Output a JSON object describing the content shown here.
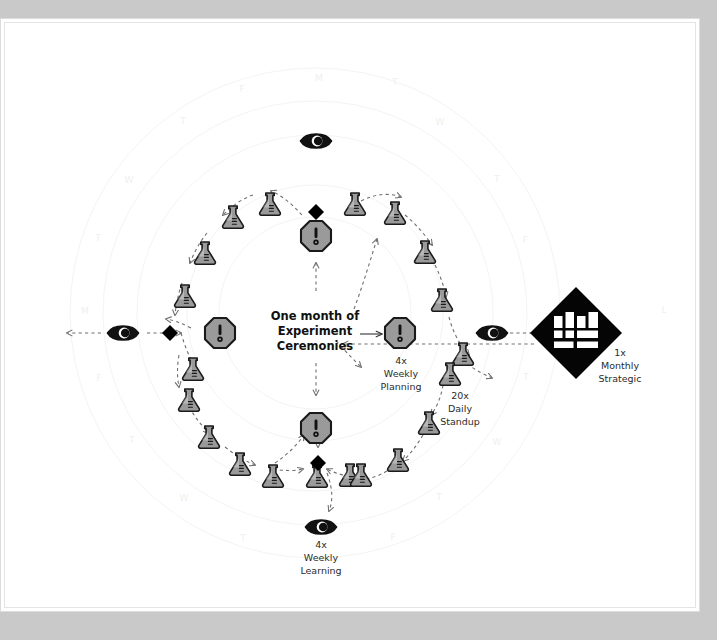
{
  "canvas": {
    "width": 717,
    "height": 640,
    "background_color": "#c9c9c9",
    "card_color": "#ffffff"
  },
  "diagram": {
    "type": "cycle-diagram",
    "title": "One month of\nExperiment\nCeremonies",
    "title_lines": [
      "One month of",
      "Experiment",
      "Ceremonies"
    ],
    "colors": {
      "icon_fill": "#9a9a9a",
      "icon_stroke": "#1a1a1a",
      "diamond_fill": "#000000",
      "ring_stroke": "#f4f4f4",
      "dash_stroke": "#6f6f6f",
      "text": "#111111",
      "day_label": "#efefef"
    },
    "center_label": {
      "lines": [
        "One month of",
        "Experiment",
        "Ceremonies"
      ],
      "arrow": "arrow-right"
    },
    "nodes": [
      {
        "id": "weekly-planning",
        "icon": "octagon-alert-icon",
        "count": "4x",
        "label_lines": [
          "4x",
          "Weekly",
          "Planning"
        ],
        "position": "center-right"
      },
      {
        "id": "daily-standup",
        "icon": "flask-icon",
        "count": "20x",
        "label_lines": [
          "20x",
          "Daily",
          "Standup"
        ],
        "position": "inner-right-lower"
      },
      {
        "id": "weekly-learning",
        "icon": "eye-icon",
        "count": "4x",
        "label_lines": [
          "4x",
          "Weekly",
          "Learning"
        ],
        "position": "bottom"
      },
      {
        "id": "monthly-strategic",
        "icon": "kanban-board-icon",
        "count": "1x",
        "label_lines": [
          "1x",
          "Monthly",
          "Strategic"
        ],
        "position": "far-right"
      }
    ],
    "ceremony_legend": [
      {
        "name": "Weekly Planning",
        "frequency": "4x",
        "icon": "octagon-alert-icon"
      },
      {
        "name": "Daily Standup",
        "frequency": "20x",
        "icon": "flask-icon"
      },
      {
        "name": "Weekly Learning",
        "frequency": "4x",
        "icon": "eye-icon"
      },
      {
        "name": "Monthly Strategic",
        "frequency": "1x",
        "icon": "kanban-board-icon"
      }
    ],
    "icon_counts": {
      "flask": 20,
      "octagon_alert": 4,
      "eye": 4,
      "diamond": 4,
      "kanban_board": 1
    },
    "day_letters": [
      "M",
      "T",
      "W",
      "T",
      "F"
    ],
    "day_marks": [
      {
        "letter": "M",
        "x": 314,
        "y": 58
      },
      {
        "letter": "T",
        "x": 178,
        "y": 101
      },
      {
        "letter": "F",
        "x": 237,
        "y": 69
      },
      {
        "letter": "W",
        "x": 435,
        "y": 102
      },
      {
        "letter": "T",
        "x": 390,
        "y": 62
      },
      {
        "letter": "W",
        "x": 124,
        "y": 160
      },
      {
        "letter": "T",
        "x": 492,
        "y": 159
      },
      {
        "letter": "T",
        "x": 93,
        "y": 218
      },
      {
        "letter": "F",
        "x": 520,
        "y": 220
      },
      {
        "letter": "M",
        "x": 80,
        "y": 291
      },
      {
        "letter": "L",
        "x": 659,
        "y": 290
      },
      {
        "letter": "F",
        "x": 94,
        "y": 358
      },
      {
        "letter": "T",
        "x": 521,
        "y": 357
      },
      {
        "letter": "T",
        "x": 127,
        "y": 420
      },
      {
        "letter": "W",
        "x": 492,
        "y": 422
      },
      {
        "letter": "W",
        "x": 179,
        "y": 478
      },
      {
        "letter": "T",
        "x": 434,
        "y": 477
      },
      {
        "letter": "T",
        "x": 238,
        "y": 518
      },
      {
        "letter": "F",
        "x": 388,
        "y": 517
      }
    ]
  }
}
